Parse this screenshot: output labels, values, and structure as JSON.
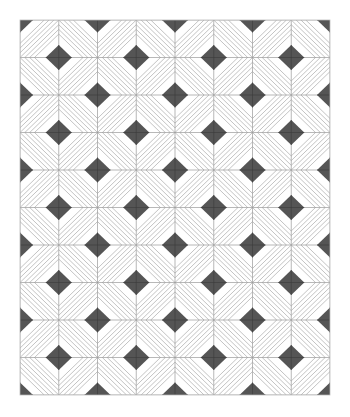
{
  "pattern": {
    "name": "diamond-chevron-tile-pattern",
    "origin": [
      20,
      20
    ],
    "columns": 8,
    "rows": 10,
    "cell_width": 38.75,
    "cell_height": 37.5,
    "diamond_half_width": 13,
    "diamond_half_height": 12.5,
    "stripes_per_cell": 7,
    "colors": {
      "background": "#ffffff",
      "diamond": "#555555",
      "grid_line": "#9a9a9a",
      "stripe": "#b4b4b4",
      "border": "#bdbdbd"
    }
  }
}
